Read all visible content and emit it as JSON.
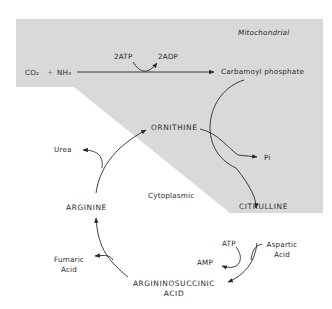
{
  "diagram": {
    "regions": {
      "mitochondrial": "Mitochondrial",
      "cytoplasmic": "Cytoplasmic"
    },
    "colors": {
      "mitochondrial_fill": "#d9d9d9",
      "line": "#2a2a2a",
      "background": "#ffffff"
    },
    "reactants": {
      "co2": "CO₂",
      "plus": "+",
      "nh3": "NH₃"
    },
    "cofactors": {
      "atp_in": "2ATP",
      "adp_out": "2ADP",
      "atp": "ATP",
      "amp": "AMP"
    },
    "nodes": {
      "carbamoyl_phosphate": "Carbamoyl phosphate",
      "ornithine": "ORNITHINE",
      "citrulline": "CITRULLINE",
      "argininosuccinic_line1": "ARGININOSUCCINIC",
      "argininosuccinic_line2": "ACID",
      "arginine": "ARGININE"
    },
    "byproducts": {
      "pi": "Pi",
      "urea": "Urea",
      "fumaric_line1": "Fumaric",
      "fumaric_line2": "Acid",
      "aspartic_line1": "Aspartic",
      "aspartic_line2": "Acid"
    }
  }
}
